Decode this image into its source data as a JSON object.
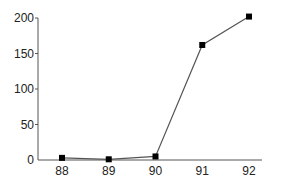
{
  "chart_data": {
    "type": "line",
    "title": "",
    "xlabel": "",
    "ylabel": "",
    "categories": [
      "88",
      "89",
      "90",
      "91",
      "92"
    ],
    "series": [
      {
        "name": "series-1",
        "values": [
          3,
          1,
          5,
          162,
          202
        ],
        "marker": "square",
        "color": "#000000"
      }
    ],
    "ylim": [
      0,
      200
    ],
    "yticks": [
      0,
      50,
      100,
      150,
      200
    ],
    "xticks": [
      "88",
      "89",
      "90",
      "91",
      "92"
    ],
    "grid": false,
    "legend": null
  },
  "colors": {
    "axis": "#555555",
    "line": "#555555",
    "marker": "#000000"
  }
}
